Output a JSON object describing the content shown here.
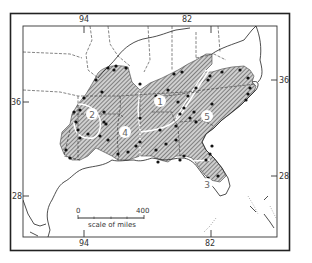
{
  "map": {
    "title": "",
    "longitude_labels_top": [
      "94",
      "82"
    ],
    "longitude_labels_bottom": [
      "94",
      "82"
    ],
    "latitude_labels_left": [
      "36",
      "28"
    ],
    "latitude_labels_right": [
      "36",
      "28"
    ],
    "regions": [
      {
        "id": "1",
        "label": "1"
      },
      {
        "id": "2",
        "label": "2"
      },
      {
        "id": "3",
        "label": "3"
      },
      {
        "id": "4",
        "label": "4"
      },
      {
        "id": "5",
        "label": "5"
      }
    ],
    "scale_bar": {
      "start_label": "0",
      "end_label": "400",
      "caption": "scale of miles"
    },
    "legend": {
      "hatched_area": "distribution range",
      "dots": "locality records"
    },
    "colors": {
      "hatch": "#555555",
      "shade": "#c8c8c8",
      "ink": "#222222",
      "paper": "#ffffff"
    }
  }
}
